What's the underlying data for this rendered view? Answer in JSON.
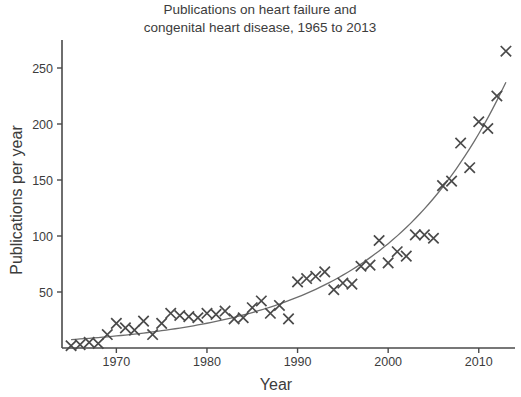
{
  "chart_data": {
    "type": "scatter",
    "title": "Publications on heart failure and congenital heart disease, 1965 to 2013",
    "title_line1": "Publications on heart failure and",
    "title_line2": "congenital heart disease, 1965 to 2013",
    "xlabel": "Year",
    "ylabel": "Publications per year",
    "xlim": [
      1964,
      2014
    ],
    "ylim": [
      0,
      275
    ],
    "xticks": [
      1970,
      1980,
      1990,
      2000,
      2010
    ],
    "yticks": [
      50,
      100,
      150,
      200,
      250
    ],
    "xtick_labels": [
      "1970",
      "1980",
      "1990",
      "2000",
      "2010"
    ],
    "ytick_labels": [
      "50",
      "100",
      "150",
      "200",
      "250"
    ],
    "grid": false,
    "legend": "none",
    "marker_style": "x",
    "marker_color": "#4a4a4a",
    "curve_color": "#6d6d6d",
    "curve_label": "exponential trend fit",
    "x": [
      1965,
      1966,
      1967,
      1968,
      1969,
      1970,
      1971,
      1972,
      1973,
      1974,
      1975,
      1976,
      1977,
      1978,
      1979,
      1980,
      1981,
      1982,
      1983,
      1984,
      1985,
      1986,
      1987,
      1988,
      1989,
      1990,
      1991,
      1992,
      1993,
      1994,
      1995,
      1996,
      1997,
      1998,
      1999,
      2000,
      2001,
      2002,
      2003,
      2004,
      2005,
      2006,
      2007,
      2008,
      2009,
      2010,
      2011,
      2012,
      2013
    ],
    "values": [
      2,
      3,
      5,
      4,
      12,
      22,
      18,
      16,
      24,
      12,
      22,
      31,
      29,
      28,
      27,
      31,
      30,
      33,
      26,
      27,
      36,
      42,
      31,
      38,
      26,
      59,
      62,
      64,
      68,
      52,
      58,
      57,
      73,
      74,
      96,
      76,
      86,
      82,
      101,
      101,
      98,
      145,
      149,
      183,
      161,
      202,
      196,
      225,
      265
    ],
    "curve_points_note": "Smooth exponential fit rising from about 5 in 1965 to about 250 in 2013"
  },
  "axes": {
    "y_axis_name": "y-axis",
    "x_axis_name": "x-axis"
  }
}
